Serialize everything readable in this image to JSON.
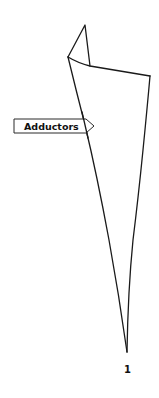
{
  "diagram": {
    "type": "muscle-shape-illustration",
    "label": {
      "text": "Adductors",
      "pointer_direction": "right"
    },
    "figure_number": "1",
    "colors": {
      "stroke": "#1a1a1a",
      "background": "#ffffff",
      "label_fill": "#ffffff",
      "text": "#111111"
    }
  }
}
